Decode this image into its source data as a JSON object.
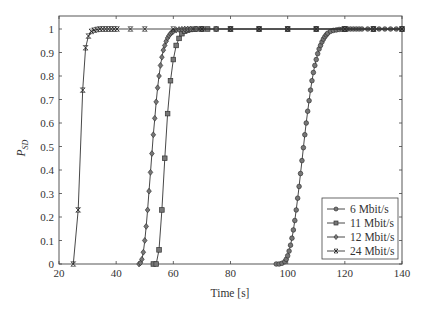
{
  "chart_data": {
    "type": "line",
    "title": "",
    "xlabel": "Time [s]",
    "ylabel": "P_SD",
    "ylabel_main": "P",
    "ylabel_sub": "SD",
    "xlim": [
      20,
      140
    ],
    "ylim": [
      0,
      1.05
    ],
    "xticks": [
      20,
      40,
      60,
      80,
      100,
      120,
      140
    ],
    "yticks": [
      0,
      0.1,
      0.2,
      0.3,
      0.4,
      0.5,
      0.6,
      0.7,
      0.8,
      0.9,
      1
    ],
    "grid": false,
    "legend_position": "lower right",
    "series": [
      {
        "name": "6 Mbit/s",
        "marker": "circle",
        "x": [
          96,
          97,
          98,
          99,
          99.5,
          100,
          100.5,
          101,
          101.5,
          102,
          102.5,
          103,
          103.5,
          104,
          104.5,
          105,
          105.5,
          106,
          106.5,
          107,
          107.5,
          108,
          108.5,
          109,
          109.5,
          110,
          110.5,
          111,
          111.5,
          112,
          112.5,
          113,
          113.5,
          114,
          115,
          116,
          117,
          118,
          119,
          120,
          121,
          122,
          123,
          124,
          125,
          126,
          128,
          130,
          132,
          134,
          136,
          138,
          140
        ],
        "y": [
          0,
          0,
          0.003,
          0.01,
          0.02,
          0.035,
          0.055,
          0.08,
          0.11,
          0.145,
          0.185,
          0.23,
          0.28,
          0.33,
          0.385,
          0.44,
          0.495,
          0.55,
          0.6,
          0.65,
          0.695,
          0.74,
          0.78,
          0.815,
          0.845,
          0.87,
          0.895,
          0.915,
          0.93,
          0.945,
          0.957,
          0.967,
          0.975,
          0.982,
          0.99,
          0.994,
          0.996,
          0.998,
          0.999,
          0.999,
          1,
          1,
          1,
          1,
          1,
          1,
          1,
          1,
          1,
          1,
          1,
          1,
          1
        ]
      },
      {
        "name": "11 Mbit/s",
        "marker": "square",
        "x": [
          53,
          54,
          55,
          56,
          57,
          58,
          59,
          60,
          61,
          62,
          63,
          64,
          65,
          66,
          67,
          68,
          70,
          72,
          75,
          80,
          90,
          100,
          110,
          120,
          130,
          140
        ],
        "y": [
          0,
          0,
          0.06,
          0.23,
          0.45,
          0.64,
          0.78,
          0.87,
          0.93,
          0.96,
          0.98,
          0.99,
          0.995,
          0.998,
          0.999,
          1,
          1,
          1,
          1,
          1,
          1,
          1,
          1,
          1,
          1,
          1
        ]
      },
      {
        "name": "12 Mbit/s",
        "marker": "diamond",
        "x": [
          48,
          48.5,
          49,
          49.5,
          50,
          50.5,
          51,
          51.5,
          52,
          52.5,
          53,
          53.5,
          54,
          54.5,
          55,
          55.5,
          56,
          56.5,
          57,
          57.5,
          58,
          58.5,
          59,
          59.5,
          60,
          61,
          62,
          63,
          64,
          65,
          66,
          68,
          70,
          75,
          80,
          90,
          100,
          110,
          120,
          130,
          140
        ],
        "y": [
          0,
          0.005,
          0.02,
          0.05,
          0.1,
          0.16,
          0.23,
          0.31,
          0.39,
          0.47,
          0.55,
          0.62,
          0.69,
          0.75,
          0.8,
          0.845,
          0.88,
          0.91,
          0.93,
          0.948,
          0.962,
          0.972,
          0.98,
          0.986,
          0.99,
          0.995,
          0.998,
          0.999,
          1,
          1,
          1,
          1,
          1,
          1,
          1,
          1,
          1,
          1,
          1,
          1,
          1
        ]
      },
      {
        "name": "24 Mbit/s",
        "marker": "x",
        "x": [
          25,
          26.7,
          28.3,
          29.3,
          30.3,
          31.3,
          32.3,
          33.3,
          34.3,
          35.3,
          36.3,
          37.3,
          38.3,
          39.3,
          40.3,
          45,
          50,
          60,
          70,
          80,
          90,
          100,
          110,
          120,
          130,
          140
        ],
        "y": [
          0,
          0.23,
          0.74,
          0.92,
          0.97,
          0.99,
          0.995,
          0.998,
          1,
          1,
          1,
          1,
          1,
          1,
          1,
          1,
          1,
          1,
          1,
          1,
          1,
          1,
          1,
          1,
          1,
          1
        ]
      }
    ]
  },
  "legend": {
    "items": [
      "6 Mbit/s",
      "11 Mbit/s",
      "12 Mbit/s",
      "24 Mbit/s"
    ]
  }
}
